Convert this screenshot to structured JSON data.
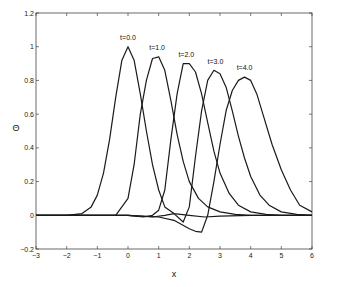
{
  "chart_data": {
    "type": "line",
    "title": "",
    "xlabel": "x",
    "ylabel": "Θ",
    "xlim": [
      -3,
      6
    ],
    "ylim": [
      -0.2,
      1.2
    ],
    "xticks": [
      -3,
      -2,
      -1,
      0,
      1,
      2,
      3,
      4,
      5,
      6
    ],
    "yticks": [
      -0.2,
      0,
      0.2,
      0.4,
      0.6,
      0.8,
      1,
      1.2
    ],
    "xtick_labels": [
      "-3",
      "-2",
      "-1",
      "0",
      "1",
      "2",
      "3",
      "4",
      "5",
      "6"
    ],
    "ytick_labels": [
      "-0.2",
      "0",
      "0.2",
      "0.4",
      "0.6",
      "0.8",
      "1",
      "1.2"
    ],
    "grid": false,
    "legend": null,
    "series": [
      {
        "name": "t=0.0",
        "label_pos": [
          0.0,
          1.04
        ],
        "x": [
          -3,
          -2,
          -1.5,
          -1.2,
          -1,
          -0.8,
          -0.6,
          -0.4,
          -0.2,
          0,
          0.2,
          0.4,
          0.6,
          0.8,
          1.0,
          1.2,
          1.5,
          2,
          2.5,
          3,
          4,
          5,
          6
        ],
        "y": [
          0,
          0,
          0.01,
          0.05,
          0.12,
          0.25,
          0.45,
          0.7,
          0.92,
          1.0,
          0.92,
          0.72,
          0.5,
          0.3,
          0.15,
          0.05,
          0.01,
          0.0,
          -0.01,
          -0.005,
          0,
          0,
          0
        ]
      },
      {
        "name": "t=1.0",
        "label_pos": [
          0.95,
          0.98
        ],
        "x": [
          -3,
          -1,
          -0.4,
          0,
          0.2,
          0.4,
          0.6,
          0.8,
          1.0,
          1.2,
          1.4,
          1.6,
          1.8,
          2.0,
          2.3,
          2.6,
          3,
          3.5,
          4,
          5,
          6
        ],
        "y": [
          0,
          0,
          0.0,
          0.1,
          0.3,
          0.6,
          0.8,
          0.93,
          0.94,
          0.86,
          0.68,
          0.48,
          0.32,
          0.2,
          0.1,
          0.05,
          0.02,
          0.005,
          0,
          0,
          0
        ]
      },
      {
        "name": "t=2.0",
        "label_pos": [
          1.9,
          0.94
        ],
        "x": [
          -3,
          0,
          0.5,
          0.8,
          1.0,
          1.2,
          1.4,
          1.6,
          1.8,
          2.0,
          2.2,
          2.4,
          2.6,
          2.8,
          3.0,
          3.3,
          3.6,
          4,
          4.5,
          5,
          6
        ],
        "y": [
          0,
          0,
          -0.01,
          0.0,
          0.03,
          0.15,
          0.45,
          0.72,
          0.9,
          0.9,
          0.85,
          0.72,
          0.55,
          0.38,
          0.25,
          0.13,
          0.06,
          0.02,
          0.005,
          0,
          0
        ]
      },
      {
        "name": "t=3.0",
        "label_pos": [
          2.85,
          0.9
        ],
        "x": [
          -3,
          0,
          0.8,
          1.2,
          1.5,
          1.8,
          2.0,
          2.2,
          2.4,
          2.6,
          2.8,
          3.0,
          3.2,
          3.4,
          3.6,
          3.8,
          4.0,
          4.3,
          4.6,
          5,
          5.5,
          6
        ],
        "y": [
          0,
          0,
          -0.01,
          0.0,
          0.01,
          -0.04,
          0.05,
          0.35,
          0.62,
          0.8,
          0.86,
          0.84,
          0.76,
          0.62,
          0.47,
          0.34,
          0.23,
          0.12,
          0.06,
          0.02,
          0.005,
          0
        ]
      },
      {
        "name": "t=4.0",
        "label_pos": [
          3.8,
          0.86
        ],
        "x": [
          -3,
          0,
          0.5,
          1.0,
          1.5,
          2.0,
          2.2,
          2.4,
          2.6,
          2.8,
          3.0,
          3.2,
          3.4,
          3.6,
          3.8,
          4.0,
          4.2,
          4.4,
          4.7,
          5.0,
          5.3,
          5.6,
          6
        ],
        "y": [
          0,
          0,
          -0.005,
          -0.01,
          -0.03,
          -0.08,
          -0.095,
          -0.1,
          0.0,
          0.2,
          0.42,
          0.62,
          0.74,
          0.8,
          0.82,
          0.8,
          0.72,
          0.6,
          0.42,
          0.27,
          0.15,
          0.06,
          0.02
        ]
      }
    ]
  }
}
